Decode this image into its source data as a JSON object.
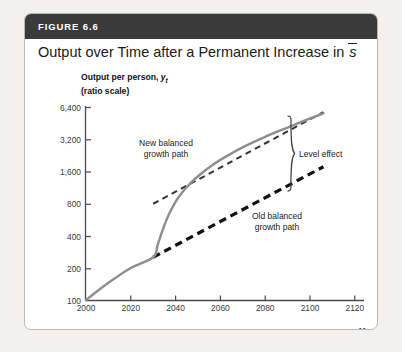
{
  "figure": {
    "number_label": "FIGURE 6.6",
    "title_prefix": "Output over Time after a Permanent Increase in ",
    "title_variable": "s"
  },
  "axes": {
    "y_caption_line1_prefix": "Output per person, ",
    "y_caption_line1_var": "y",
    "y_caption_line1_sub": "t",
    "y_caption_line2": "(ratio scale)",
    "x_caption": "Year"
  },
  "annotations": {
    "new_path_line1": "New balanced",
    "new_path_line2": "growth path",
    "old_path_line1": "Old balanced",
    "old_path_line2": "growth path",
    "level_effect": "Level effect"
  },
  "chart_data": {
    "type": "line",
    "xlabel": "Year",
    "ylabel": "Output per person, y_t (ratio scale)",
    "yscale": "log",
    "ylim": [
      100,
      6400
    ],
    "xlim": [
      2000,
      2120
    ],
    "ytick_labels": [
      "100",
      "200",
      "400",
      "800",
      "1,600",
      "3,200",
      "6,400"
    ],
    "ytick_values": [
      100,
      200,
      400,
      800,
      1600,
      3200,
      6400
    ],
    "xtick_labels": [
      "2000",
      "2020",
      "2040",
      "2060",
      "2080",
      "2100",
      "2120"
    ],
    "xtick_values": [
      2000,
      2020,
      2040,
      2060,
      2080,
      2100,
      2120
    ],
    "grid": false,
    "legend": "none",
    "series": [
      {
        "name": "Actual output trajectory",
        "style": "solid",
        "color": "#8e8e8e",
        "width": 2.4,
        "points": [
          [
            2000,
            100
          ],
          [
            2010,
            145
          ],
          [
            2020,
            200
          ],
          [
            2030,
            252
          ],
          [
            2032,
            330
          ],
          [
            2034,
            440
          ],
          [
            2036,
            570
          ],
          [
            2038,
            700
          ],
          [
            2041,
            900
          ],
          [
            2045,
            1150
          ],
          [
            2050,
            1450
          ],
          [
            2056,
            1820
          ],
          [
            2063,
            2250
          ],
          [
            2071,
            2780
          ],
          [
            2080,
            3400
          ],
          [
            2090,
            4150
          ],
          [
            2100,
            5050
          ],
          [
            2106,
            5650
          ]
        ]
      },
      {
        "name": "New balanced growth path",
        "style": "dashed",
        "color": "#333333",
        "width": 2.0,
        "points": [
          [
            2030,
            800
          ],
          [
            2106,
            5800
          ]
        ]
      },
      {
        "name": "Old balanced growth path",
        "style": "dashed",
        "color": "#111111",
        "width": 3.2,
        "points": [
          [
            2030,
            252
          ],
          [
            2106,
            1780
          ]
        ]
      }
    ],
    "callouts": [
      {
        "label": "New balanced growth path",
        "x": 2042,
        "y": 2100
      },
      {
        "label": "Old balanced growth path",
        "x": 2078,
        "y": 560
      },
      {
        "label": "Level effect",
        "x": 2120,
        "y": 2150,
        "marker": "right-brace"
      }
    ]
  }
}
